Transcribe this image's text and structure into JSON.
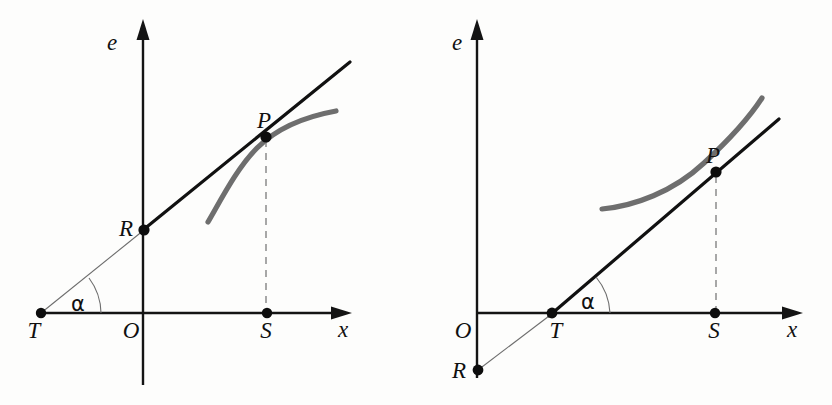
{
  "figure": {
    "background_color": "#fdfdfc",
    "curve_color": "#6e6e6e",
    "line_color": "#111111",
    "panels": [
      {
        "id": "left",
        "curve_shape": "concave-increasing",
        "axes": {
          "x_label": "x",
          "e_label": "e"
        },
        "points": [
          {
            "name": "T",
            "label": "T"
          },
          {
            "name": "O",
            "label": "O"
          },
          {
            "name": "S",
            "label": "S"
          },
          {
            "name": "R",
            "label": "R"
          },
          {
            "name": "P",
            "label": "P"
          }
        ],
        "angle": {
          "label": "α",
          "at": "T"
        }
      },
      {
        "id": "right",
        "curve_shape": "convex-increasing",
        "axes": {
          "x_label": "x",
          "e_label": "e"
        },
        "points": [
          {
            "name": "O",
            "label": "O"
          },
          {
            "name": "T",
            "label": "T"
          },
          {
            "name": "S",
            "label": "S"
          },
          {
            "name": "R",
            "label": "R"
          },
          {
            "name": "P",
            "label": "P"
          }
        ],
        "angle": {
          "label": "α",
          "at": "T"
        }
      }
    ]
  }
}
